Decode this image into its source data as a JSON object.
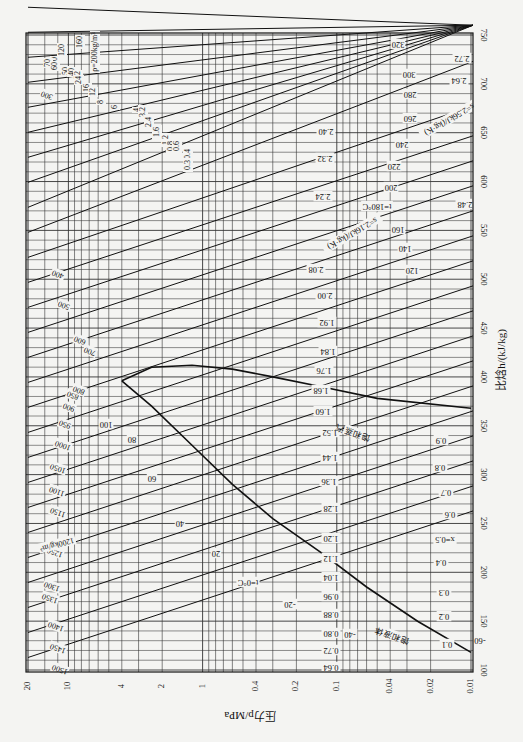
{
  "chart_data": {
    "type": "line",
    "orientation": "rotated-90-clockwise",
    "xlabel": "比焓h/(kJ/kg)",
    "ylabel": "压力p/MPa",
    "x_axis": {
      "quantity": "enthalpy",
      "unit": "kJ/kg",
      "range": [
        100,
        750
      ],
      "ticks": [
        100,
        150,
        200,
        250,
        300,
        350,
        400,
        450,
        500,
        550,
        600,
        650,
        700,
        750
      ]
    },
    "y_axis": {
      "quantity": "pressure",
      "unit": "MPa",
      "scale": "log",
      "range": [
        0.01,
        20
      ],
      "ticks": [
        0.01,
        0.02,
        0.04,
        0.1,
        0.2,
        0.4,
        1,
        2,
        4,
        10,
        20
      ],
      "tick_labels": [
        "0.01",
        "0.02",
        "0.04",
        "0.1",
        "0.2",
        "0.4",
        "1",
        "2",
        "4",
        "10",
        "20"
      ]
    },
    "grid": true,
    "critical_point": {
      "h": 396,
      "p": 4.0
    },
    "saturation_labels": {
      "liquid": "饱和液体",
      "vapor": "饱和蒸汽"
    },
    "saturated_liquid": {
      "h": [
        118,
        150,
        185,
        220,
        255,
        290,
        330,
        370,
        396
      ],
      "p": [
        0.01,
        0.025,
        0.06,
        0.13,
        0.3,
        0.6,
        1.2,
        2.4,
        4.0
      ]
    },
    "saturated_vapor": {
      "h": [
        396,
        410,
        412,
        408,
        400,
        390,
        378,
        368
      ],
      "p": [
        4.0,
        2.4,
        1.2,
        0.6,
        0.3,
        0.13,
        0.05,
        0.01
      ]
    },
    "isotherms": {
      "label_prefix": "t=",
      "unit": "°C",
      "values": [
        -60,
        -40,
        -20,
        0,
        20,
        40,
        60,
        80,
        100,
        120,
        140,
        160,
        180,
        200,
        220,
        240,
        260,
        280,
        300,
        320
      ],
      "labels": [
        "-60",
        "-40",
        "-20",
        "t=0°C",
        "20",
        "40",
        "60",
        "80",
        "100",
        "120",
        "140",
        "160",
        "t=180°C",
        "200",
        "220",
        "240",
        "260",
        "280",
        "300",
        "320"
      ]
    },
    "isentropes": {
      "unit": "kJ/(kg·K)",
      "values": [
        0.64,
        0.72,
        0.8,
        0.88,
        0.96,
        1.04,
        1.12,
        1.2,
        1.28,
        1.36,
        1.44,
        1.52,
        1.6,
        1.68,
        1.76,
        1.84,
        1.92,
        2.0,
        2.08,
        2.16,
        2.24,
        2.32,
        2.4,
        2.48,
        2.56,
        2.64,
        2.72
      ],
      "labels": [
        "0.64",
        "0.72",
        "0.80",
        "0.88",
        "0.96",
        "1.04",
        "1.12",
        "1.20",
        "1.28",
        "1.36",
        "1.44",
        "1.52",
        "1.60",
        "1.68",
        "1.76",
        "1.84",
        "1.92",
        "2.00",
        "2.08",
        "s=2.16kJ/(kg·K)",
        "2.24",
        "2.32",
        "2.40",
        "2.48",
        "s=2.56kJ/(kg·K)",
        "2.64",
        "2.72"
      ]
    },
    "quality_lines": {
      "values": [
        0.1,
        0.2,
        0.3,
        0.4,
        0.5,
        0.6,
        0.7,
        0.8,
        0.9
      ],
      "labels": [
        "0.1",
        "0.2",
        "0.3",
        "0.4",
        "x=0.5",
        "0.6",
        "0.7",
        "0.8",
        "0.9"
      ]
    },
    "isochores_liquid": {
      "unit": "kg/m³",
      "values": [
        1500,
        1450,
        1400,
        1350,
        1300,
        1250,
        1200,
        1150,
        1100,
        1050,
        1000,
        950,
        900,
        850,
        800,
        700,
        600,
        500,
        400,
        300
      ],
      "labels": [
        "1500",
        "1450",
        "1400",
        "1350",
        "1300",
        "1250",
        "1200kg/m³",
        "1150",
        "1100",
        "1050",
        "1000",
        "950",
        "900",
        "850",
        "800",
        "700",
        "600",
        "500",
        "400",
        "300"
      ]
    },
    "isochores_vapor": {
      "unit": "kg/m³",
      "values": [
        200,
        160,
        120,
        90,
        70,
        60,
        50,
        40,
        32,
        24,
        16,
        12,
        8,
        6,
        4,
        3.2,
        2.4,
        1.6,
        1.2,
        0.8,
        0.6,
        0.4,
        0.3
      ],
      "labels": [
        "ρ=200kg/m³",
        "160",
        "120",
        "90",
        "70",
        "60",
        "50",
        "40",
        "32",
        "24",
        "16",
        "12",
        "8",
        "6",
        "4",
        "3.2",
        "2.4",
        "1.6",
        "1.2",
        "0.8",
        "0.6",
        "0.4",
        "0.3"
      ]
    }
  },
  "axes": {
    "enthalpy_title": "比焓h/(kJ/kg)",
    "pressure_title": "压力p/MPa"
  }
}
